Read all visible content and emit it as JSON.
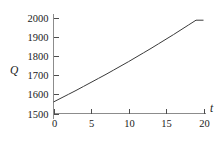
{
  "chart_data": {
    "type": "line",
    "title": "",
    "xlabel": "t",
    "ylabel": "Q",
    "xlim": [
      0,
      20
    ],
    "ylim": [
      1500,
      2000
    ],
    "grid": false,
    "legend": null,
    "x_ticks": [
      0,
      5,
      10,
      15,
      20
    ],
    "x_tick_labels": [
      "0",
      "5",
      "10",
      "15",
      "20"
    ],
    "y_ticks": [
      1500,
      1600,
      1700,
      1800,
      1900,
      2000
    ],
    "y_tick_labels": [
      "1500",
      "1600",
      "1700",
      "1800",
      "1900",
      "2000"
    ],
    "series": [
      {
        "name": "Q",
        "x": [
          0,
          1,
          2,
          3,
          4,
          5,
          6,
          7,
          8,
          9,
          10,
          11,
          12,
          13,
          14,
          15,
          16,
          17,
          18,
          19,
          20
        ],
        "values": [
          1560,
          1580,
          1600,
          1620,
          1641,
          1662,
          1683,
          1704,
          1726,
          1748,
          1770,
          1793,
          1816,
          1839,
          1863,
          1887,
          1911,
          1936,
          1961,
          1986,
          1986
        ]
      }
    ],
    "curve_color": "#3a3a3a",
    "axis_color": "#8c8c8c",
    "tick_color": "#4d4d4d",
    "background_color": "#ffffff"
  },
  "axes": {
    "y_label": "Q",
    "x_label": "t"
  }
}
